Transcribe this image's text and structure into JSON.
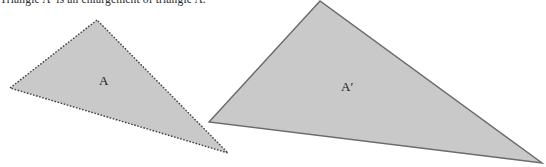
{
  "figure": {
    "caption": "Triangle A′ is an enlargement of triangle A.",
    "background_color": "#ffffff",
    "width": 546,
    "height": 167
  },
  "shapes": {
    "fill_color": "#c9c9c9",
    "stroke_color": "#4a4a4a",
    "triangle_a": {
      "label": "A",
      "border_style": "dotted",
      "points": "97,20 10,88 228,153"
    },
    "triangle_a_prime": {
      "label": "A′",
      "border_style": "solid",
      "points": "320,1 209,122 542,163"
    }
  }
}
